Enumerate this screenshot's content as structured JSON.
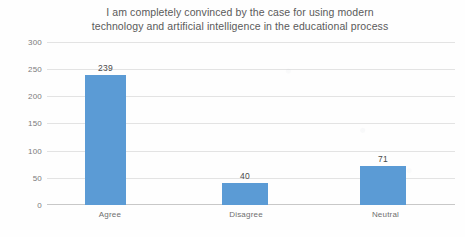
{
  "chart_data": {
    "type": "bar",
    "title": "I am completely convinced by the case for using modern\ntechnology and artificial intelligence in the educational process",
    "title_line1": "I am completely convinced by the case for using modern",
    "title_line2": "technology and artificial intelligence in the educational process",
    "categories": [
      "Agree",
      "Disagree",
      "Neutral"
    ],
    "values": [
      239,
      40,
      71
    ],
    "data_labels": [
      "239",
      "40",
      "71"
    ],
    "xlabel": "",
    "ylabel": "",
    "ylim": [
      0,
      300
    ],
    "ytick_values": [
      300,
      250,
      200,
      150,
      100,
      50,
      0
    ],
    "ytick_labels": [
      "300",
      "250",
      "200",
      "150",
      "100",
      "50",
      "0"
    ],
    "grid": true,
    "grid_axis": "y",
    "legend": false,
    "legend_position": "none",
    "series": [
      {
        "name": "Responses",
        "values": [
          239,
          40,
          71
        ]
      }
    ],
    "colors": {
      "bar": "#5b9bd5",
      "gridline": "#e3e3e3",
      "baseline": "#c8c8c8",
      "title_text": "#5a5a5a",
      "tick_text": "#7b7b7b",
      "label_text": "#4a4a4a",
      "background": "#ffffff"
    }
  }
}
